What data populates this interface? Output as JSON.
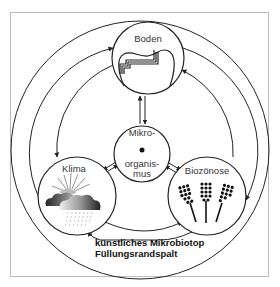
{
  "diagram": {
    "type": "cycle-relationship-diagram",
    "nodes": {
      "boden": {
        "label": "Boden",
        "icon": "tooth-cavity-icon"
      },
      "mikro": {
        "label_line1": "Mikro-",
        "label_line2": "organis-",
        "label_line3": "mus",
        "icon": "dot-icon"
      },
      "klima": {
        "label": "Klima",
        "icon": "sun-cloud-rain-icon"
      },
      "biozoenose": {
        "label": "Biozönose",
        "icon": "bacteria-colonies-icon"
      }
    },
    "caption": {
      "line1": "künstliches Mikrobiotop",
      "line2": "Füllungsrandspalt"
    },
    "edges": [
      {
        "from": "mikro",
        "to": "boden",
        "bidirectional": true
      },
      {
        "from": "mikro",
        "to": "klima",
        "bidirectional": true
      },
      {
        "from": "mikro",
        "to": "biozoenose",
        "bidirectional": true
      },
      {
        "from": "klima",
        "to": "boden",
        "style": "arc"
      },
      {
        "from": "biozoenose",
        "to": "boden",
        "style": "arc"
      },
      {
        "from": "boden",
        "to": "klima",
        "style": "arc"
      },
      {
        "from": "boden",
        "to": "biozoenose",
        "style": "arc"
      },
      {
        "from": "klima",
        "to": "biozoenose",
        "style": "arc"
      }
    ],
    "colors": {
      "line": "#222222",
      "frame": "#bbbbbb",
      "background": "#ffffff"
    }
  }
}
